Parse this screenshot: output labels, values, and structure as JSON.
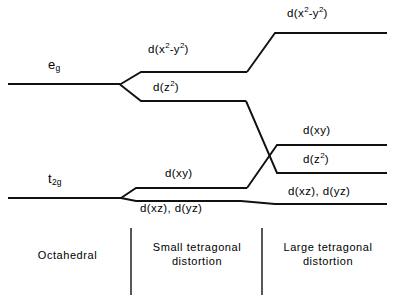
{
  "figure": {
    "type": "energy-level-diagram",
    "background_color": "#ffffff",
    "line_color": "#111111"
  },
  "terms": [
    {
      "id": "eg",
      "label_html": "e<sub>g</sub>",
      "label_text": "eg",
      "x": 48,
      "y": 66
    },
    {
      "id": "t2g",
      "label_html": "t<sub>2g</sub>",
      "label_text": "t2g",
      "x": 48,
      "y": 180
    }
  ],
  "columns": [
    {
      "id": "octahedral",
      "label": "Octahedral",
      "lines": [
        "Octahedral"
      ]
    },
    {
      "id": "small-tetragonal",
      "label": "Small tetragonal distortion",
      "lines": [
        "Small tetragonal",
        "distortion"
      ]
    },
    {
      "id": "large-tetragonal",
      "label": "Large tetragonal distortion",
      "lines": [
        "Large tetragonal",
        "distortion"
      ]
    }
  ],
  "dividers": [
    {
      "id": "divider-1",
      "x": 131,
      "y1": 228,
      "y2": 295
    },
    {
      "id": "divider-2",
      "x": 262,
      "y1": 228,
      "y2": 295
    }
  ],
  "orbital_labels": [
    {
      "id": "eg-dx2y2-mid",
      "html": "d(x<sup>2</sup>-y<sup>2</sup>)",
      "text": "d(x2-y2)",
      "x": 150,
      "y": 50
    },
    {
      "id": "eg-dz2-mid",
      "html": "d(z<sup>2</sup>)",
      "text": "d(z2)",
      "x": 155,
      "y": 85
    },
    {
      "id": "eg-dx2y2-far",
      "html": "d(x<sup>2</sup>-y<sup>2</sup>)",
      "text": "d(x2-y2)",
      "x": 288,
      "y": 12
    },
    {
      "id": "t2g-dxy-mid",
      "html": "d(xy)",
      "text": "d(xy)",
      "x": 165,
      "y": 172
    },
    {
      "id": "t2g-dxzdyz-mid",
      "html": "d(xz), d(yz)",
      "text": "d(xz), d(yz)",
      "x": 145,
      "y": 202
    },
    {
      "id": "far-dxy",
      "html": "d(xy)",
      "text": "d(xy)",
      "x": 302,
      "y": 128
    },
    {
      "id": "far-dz2",
      "html": "d(z<sup>2</sup>)",
      "text": "d(z2)",
      "x": 302,
      "y": 158
    },
    {
      "id": "far-dxzdyz",
      "html": "d(xz), d(yz)",
      "text": "d(xz), d(yz)",
      "x": 290,
      "y": 185
    }
  ],
  "chart_data": {
    "type": "line",
    "xlabel": "",
    "ylabel": "Energy",
    "grid": false,
    "legend": "none",
    "categories": [
      "Octahedral",
      "Small tetragonal distortion",
      "Large tetragonal distortion"
    ],
    "levels": [
      {
        "id": "eg",
        "stage": "Octahedral",
        "label": "eg",
        "y_px": 84,
        "x_start": 8,
        "x_end": 120
      },
      {
        "id": "t2g",
        "stage": "Octahedral",
        "label": "t2g",
        "y_px": 198,
        "x_start": 8,
        "x_end": 121
      },
      {
        "id": "s-dx2y2",
        "stage": "Small tetragonal distortion",
        "label": "d(x2-y2)",
        "y_px": 72,
        "x_start": 142,
        "x_end": 247
      },
      {
        "id": "s-dz2",
        "stage": "Small tetragonal distortion",
        "label": "d(z2)",
        "y_px": 101,
        "x_start": 142,
        "x_end": 246
      },
      {
        "id": "s-dxy",
        "stage": "Small tetragonal distortion",
        "label": "d(xy)",
        "y_px": 188,
        "x_start": 136,
        "x_end": 247
      },
      {
        "id": "s-dxzdyz",
        "stage": "Small tetragonal distortion",
        "label": "d(xz), d(yz)",
        "y_px": 201,
        "x_start": 136,
        "x_end": 241
      },
      {
        "id": "l-dx2y2",
        "stage": "Large tetragonal distortion",
        "label": "d(x2-y2)",
        "y_px": 33,
        "x_start": 275,
        "x_end": 387
      },
      {
        "id": "l-dxy",
        "stage": "Large tetragonal distortion",
        "label": "d(xy)",
        "y_px": 145,
        "x_start": 277,
        "x_end": 387
      },
      {
        "id": "l-dz2",
        "stage": "Large tetragonal distortion",
        "label": "d(z2)",
        "y_px": 173,
        "x_start": 277,
        "x_end": 387
      },
      {
        "id": "l-dxzdyz",
        "stage": "Large tetragonal distortion",
        "label": "d(xz), d(yz)",
        "y_px": 204,
        "x_start": 275,
        "x_end": 387
      }
    ],
    "correlations": [
      {
        "from": "eg",
        "to": [
          "s-dx2y2",
          "s-dz2"
        ]
      },
      {
        "from": "t2g",
        "to": [
          "s-dxy",
          "s-dxzdyz"
        ]
      },
      {
        "from": "s-dx2y2",
        "to": [
          "l-dx2y2"
        ]
      },
      {
        "from": "s-dz2",
        "to": [
          "l-dz2"
        ],
        "note": "crosses d(xy) correlation line"
      },
      {
        "from": "s-dxy",
        "to": [
          "l-dxy"
        ],
        "note": "crosses d(z2) correlation line"
      },
      {
        "from": "s-dxzdyz",
        "to": [
          "l-dxzdyz"
        ]
      }
    ]
  }
}
